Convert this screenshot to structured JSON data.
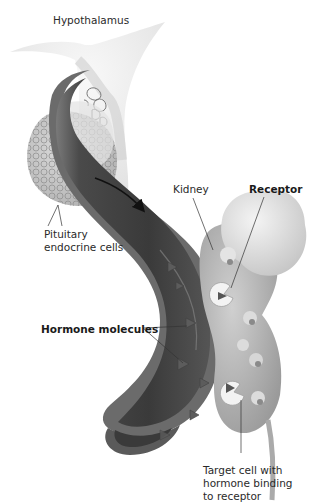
{
  "diagram": {
    "type": "anatomical-illustration",
    "colors": {
      "background": "#ffffff",
      "brain_tissue": "#e6e6e6",
      "vessel_dark": "#3a3a3a",
      "vessel_wall": "#6e6e6e",
      "kidney": "#b5b5b5",
      "adrenal": "#d9d9d9",
      "receptor": "#f2f2f2",
      "hormone": "#5a5a5a",
      "text": "#2a2a2a"
    },
    "labels": {
      "hypothalamus": "Hypothalamus",
      "pituitary": "Pituitary\nendocrine cells",
      "pituitary_line1": "Pituitary",
      "pituitary_line2": "endocrine cells",
      "kidney": "Kidney",
      "receptor": "Receptor",
      "hormone_molecules": "Hormone molecules",
      "target_line1": "Target cell with",
      "target_line2": "hormone binding",
      "target_line3": "to receptor"
    }
  }
}
